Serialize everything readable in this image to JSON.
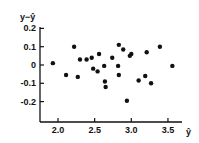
{
  "chart_data": {
    "type": "scatter",
    "title": "",
    "xlabel": "ŷ",
    "ylabel": "y−ŷ",
    "xlim": [
      1.8,
      3.8
    ],
    "ylim": [
      -0.3,
      0.22
    ],
    "x_ticks": [
      "2.0",
      "2.5",
      "3.0",
      "3.5"
    ],
    "y_ticks": [
      "0.2",
      "0.1",
      "0",
      "-0.1",
      "-0.2"
    ],
    "grid": false,
    "legend": null,
    "points": [
      {
        "x": 1.93,
        "y": 0.01
      },
      {
        "x": 2.11,
        "y": -0.055
      },
      {
        "x": 2.22,
        "y": 0.1
      },
      {
        "x": 2.27,
        "y": -0.065
      },
      {
        "x": 2.3,
        "y": 0.03
      },
      {
        "x": 2.39,
        "y": 0.03
      },
      {
        "x": 2.46,
        "y": 0.04
      },
      {
        "x": 2.48,
        "y": -0.02
      },
      {
        "x": 2.54,
        "y": -0.035
      },
      {
        "x": 2.56,
        "y": 0.06
      },
      {
        "x": 2.63,
        "y": -0.005
      },
      {
        "x": 2.64,
        "y": -0.09
      },
      {
        "x": 2.65,
        "y": -0.12
      },
      {
        "x": 2.74,
        "y": 0.04
      },
      {
        "x": 2.82,
        "y": -0.005
      },
      {
        "x": 2.83,
        "y": 0.11
      },
      {
        "x": 2.83,
        "y": -0.055
      },
      {
        "x": 2.89,
        "y": 0.085
      },
      {
        "x": 2.94,
        "y": -0.195
      },
      {
        "x": 2.98,
        "y": 0.05
      },
      {
        "x": 3.0,
        "y": 0.06
      },
      {
        "x": 3.1,
        "y": -0.085
      },
      {
        "x": 3.19,
        "y": -0.06
      },
      {
        "x": 3.21,
        "y": 0.07
      },
      {
        "x": 3.27,
        "y": -0.1
      },
      {
        "x": 3.39,
        "y": 0.1
      },
      {
        "x": 3.56,
        "y": -0.005
      }
    ]
  }
}
